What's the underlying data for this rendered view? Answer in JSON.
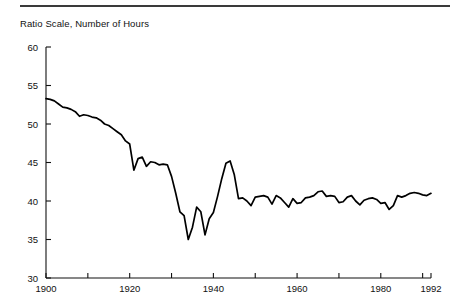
{
  "figure": {
    "axis_title": "Ratio Scale, Number of Hours",
    "rule_color": "#3a3a3a",
    "line_color": "#000000",
    "background": "#ffffff"
  },
  "chart_data": {
    "type": "line",
    "title": "",
    "subtitle": "",
    "axis_title": "Ratio Scale, Number of Hours",
    "xlabel": "",
    "ylabel": "Ratio Scale, Number of Hours",
    "scale": "ratio (logarithmic) vertical scale",
    "grid": false,
    "legend": null,
    "xlim": [
      1900,
      1992
    ],
    "ylim": [
      30,
      60
    ],
    "yticks": [
      30,
      35,
      40,
      45,
      50,
      55,
      60
    ],
    "ytick_labels": [
      "30",
      "35",
      "40",
      "45",
      "50",
      "55",
      "60"
    ],
    "xticks": [
      1900,
      1910,
      1920,
      1930,
      1940,
      1950,
      1960,
      1970,
      1980,
      1990
    ],
    "xtick_labels_shown": [
      "1900",
      "1920",
      "1940",
      "1960",
      "1980",
      "1992"
    ],
    "xtick_labels_positions": [
      1900,
      1920,
      1940,
      1960,
      1980,
      1992
    ],
    "series": [
      {
        "name": "Average weekly hours",
        "x": [
          1900,
          1901,
          1902,
          1903,
          1904,
          1905,
          1906,
          1907,
          1908,
          1909,
          1910,
          1911,
          1912,
          1913,
          1914,
          1915,
          1916,
          1917,
          1918,
          1919,
          1920,
          1921,
          1922,
          1923,
          1924,
          1925,
          1926,
          1927,
          1928,
          1929,
          1930,
          1931,
          1932,
          1933,
          1934,
          1935,
          1936,
          1937,
          1938,
          1939,
          1940,
          1941,
          1942,
          1943,
          1944,
          1945,
          1946,
          1947,
          1948,
          1949,
          1950,
          1951,
          1952,
          1953,
          1954,
          1955,
          1956,
          1957,
          1958,
          1959,
          1960,
          1961,
          1962,
          1963,
          1964,
          1965,
          1966,
          1967,
          1968,
          1969,
          1970,
          1971,
          1972,
          1973,
          1974,
          1975,
          1976,
          1977,
          1978,
          1979,
          1980,
          1981,
          1982,
          1983,
          1984,
          1985,
          1986,
          1987,
          1988,
          1989,
          1990,
          1991,
          1992
        ],
        "values": [
          53.3,
          53.2,
          53.0,
          52.6,
          52.2,
          52.1,
          51.9,
          51.6,
          51.0,
          51.2,
          51.1,
          50.9,
          50.8,
          50.5,
          50.0,
          49.8,
          49.4,
          49.0,
          48.6,
          47.8,
          47.4,
          44.0,
          45.5,
          45.7,
          44.5,
          45.1,
          45.0,
          44.7,
          44.8,
          44.7,
          43.2,
          41.0,
          38.6,
          38.1,
          35.0,
          36.6,
          39.2,
          38.6,
          35.6,
          37.7,
          38.5,
          40.6,
          42.9,
          44.9,
          45.2,
          43.4,
          40.3,
          40.4,
          40.0,
          39.4,
          40.5,
          40.6,
          40.7,
          40.5,
          39.6,
          40.7,
          40.4,
          39.8,
          39.2,
          40.3,
          39.7,
          39.8,
          40.4,
          40.5,
          40.7,
          41.2,
          41.3,
          40.6,
          40.7,
          40.6,
          39.8,
          39.9,
          40.5,
          40.7,
          40.0,
          39.5,
          40.1,
          40.3,
          40.4,
          40.2,
          39.7,
          39.8,
          38.9,
          39.4,
          40.7,
          40.5,
          40.7,
          41.0,
          41.1,
          41.0,
          40.8,
          40.7,
          41.0
        ],
        "start_value": 53.3,
        "end_value": 33.4,
        "peak_value": 53.3,
        "trough_value": 33.4
      }
    ]
  }
}
